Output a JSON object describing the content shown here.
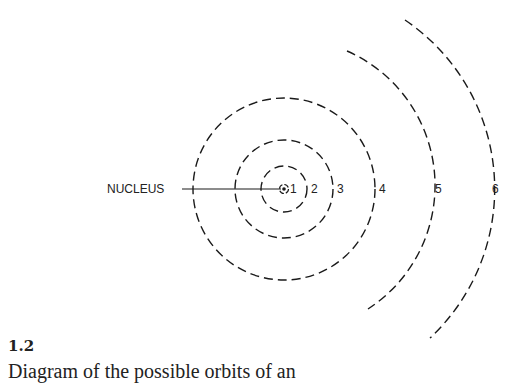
{
  "figure": {
    "number": "1.2",
    "caption": "Diagram of the possible orbits of an"
  },
  "diagram": {
    "nucleus_label": "NUCLEUS",
    "center": [
      284,
      189
    ],
    "orbits": [
      {
        "id": 1,
        "label": "1",
        "radius": 4
      },
      {
        "id": 2,
        "label": "2",
        "radius": 23
      },
      {
        "id": 3,
        "label": "3",
        "radius": 49
      },
      {
        "id": 4,
        "label": "4",
        "radius": 91
      },
      {
        "id": 5,
        "label": "5",
        "radius": 147
      },
      {
        "id": 6,
        "label": "6",
        "radius": 204
      }
    ],
    "stroke_color": "#1a1a1a"
  }
}
